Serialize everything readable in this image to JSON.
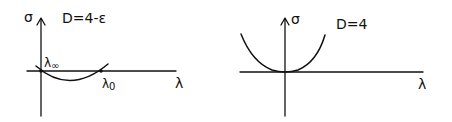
{
  "panels": [
    {
      "title": "D=4-ε",
      "y_axis_label": "σ",
      "x_axis_label": "λ",
      "points": [
        {
          "label": "λ∞",
          "sub": "∞",
          "base": "λ"
        },
        {
          "label": "λ0",
          "sub": "0",
          "base": "λ"
        }
      ],
      "curve": "arc below λ-axis between λ∞ and λ0"
    },
    {
      "title": "D=4",
      "y_axis_label": "σ",
      "x_axis_label": "λ",
      "curve": "parabola with minimum at origin"
    }
  ],
  "colors": {
    "ink": "#111111",
    "background": "#ffffff"
  }
}
